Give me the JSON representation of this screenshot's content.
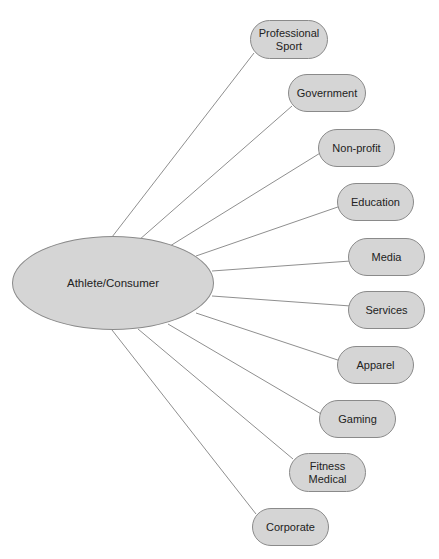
{
  "diagram": {
    "type": "hub-and-spoke",
    "center": {
      "label": "Athlete/Consumer",
      "x": 12,
      "y": 236,
      "w": 202,
      "h": 94
    },
    "nodes": [
      {
        "label": "Professional\nSport",
        "x": 250,
        "y": 20,
        "w": 78,
        "h": 39,
        "ex": 112,
        "ey": 237
      },
      {
        "label": "Government",
        "x": 288,
        "y": 74,
        "w": 78,
        "h": 38,
        "ex": 139,
        "ey": 240
      },
      {
        "label": "Non-profit",
        "x": 318,
        "y": 129,
        "w": 77,
        "h": 38,
        "ex": 170,
        "ey": 246
      },
      {
        "label": "Education",
        "x": 337,
        "y": 183,
        "w": 77,
        "h": 38,
        "ex": 196,
        "ey": 256
      },
      {
        "label": "Media",
        "x": 348,
        "y": 238,
        "w": 77,
        "h": 38,
        "ex": 212,
        "ey": 271
      },
      {
        "label": "Services",
        "x": 348,
        "y": 291,
        "w": 77,
        "h": 38,
        "ex": 212,
        "ey": 296
      },
      {
        "label": "Apparel",
        "x": 337,
        "y": 346,
        "w": 77,
        "h": 38,
        "ex": 196,
        "ey": 313
      },
      {
        "label": "Gaming",
        "x": 319,
        "y": 400,
        "w": 77,
        "h": 38,
        "ex": 168,
        "ey": 324
      },
      {
        "label": "Fitness\nMedical",
        "x": 289,
        "y": 453,
        "w": 77,
        "h": 39,
        "ex": 138,
        "ey": 329
      },
      {
        "label": "Corporate",
        "x": 252,
        "y": 508,
        "w": 77,
        "h": 38,
        "ex": 112,
        "ey": 330
      }
    ]
  },
  "colors": {
    "fill": "#d5d5d5",
    "stroke": "#8a8a8a",
    "edge": "#8f8f8f",
    "text": "#222222"
  }
}
